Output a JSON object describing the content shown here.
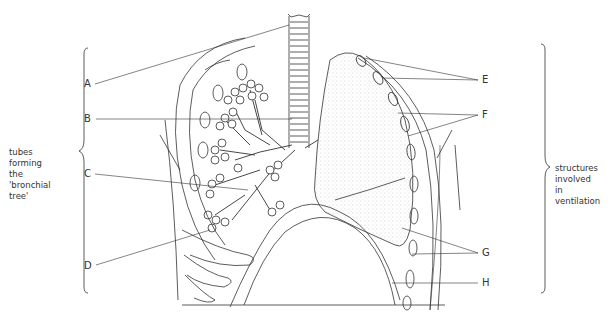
{
  "figure": {
    "type": "anatomical diagram",
    "left_group_caption": [
      "tubes",
      "forming",
      "the",
      "'bronchial",
      "tree'"
    ],
    "right_group_caption": [
      "structures",
      "involved",
      "in",
      "ventilation"
    ],
    "labels": [
      {
        "id": "A",
        "text": "A",
        "side": "left"
      },
      {
        "id": "B",
        "text": "B",
        "side": "left"
      },
      {
        "id": "C",
        "text": "C",
        "side": "left"
      },
      {
        "id": "D",
        "text": "D",
        "side": "left"
      },
      {
        "id": "E",
        "text": "E",
        "side": "right"
      },
      {
        "id": "F",
        "text": "F",
        "side": "right"
      },
      {
        "id": "G",
        "text": "G",
        "side": "right"
      },
      {
        "id": "H",
        "text": "H",
        "side": "right"
      }
    ],
    "colors": {
      "ink": "#333333",
      "stipple": "#bbbbbb",
      "background": "#ffffff"
    }
  }
}
